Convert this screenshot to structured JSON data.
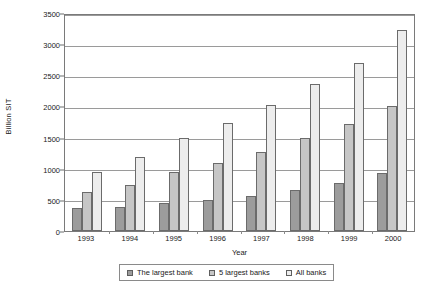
{
  "chart_data": {
    "type": "bar",
    "title": "",
    "xlabel": "Year",
    "ylabel": "Billion SIT",
    "ylim": [
      0,
      3500
    ],
    "ytick_step": 500,
    "yticks": [
      0,
      500,
      1000,
      1500,
      2000,
      2500,
      3000,
      3500
    ],
    "grid": "horizontal",
    "legend_position": "bottom",
    "categories": [
      "1993",
      "1994",
      "1995",
      "1996",
      "1997",
      "1998",
      "1999",
      "2000"
    ],
    "series": [
      {
        "name": "The largest bank",
        "color": "#9c9c9c",
        "values": [
          375,
          380,
          445,
          500,
          555,
          660,
          770,
          930
        ]
      },
      {
        "name": "5 largest banks",
        "color": "#c6c6c6",
        "values": [
          620,
          740,
          950,
          1090,
          1270,
          1500,
          1720,
          2000
        ]
      },
      {
        "name": "All banks",
        "color": "#ededed",
        "values": [
          940,
          1185,
          1500,
          1740,
          2030,
          2360,
          2690,
          3220
        ]
      }
    ]
  }
}
